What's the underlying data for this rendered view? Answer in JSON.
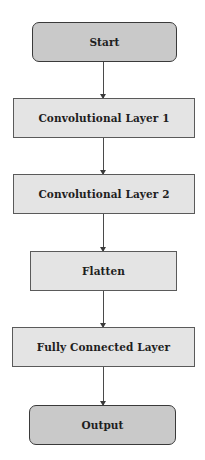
{
  "diagram": {
    "type": "flowchart",
    "direction": "top-to-bottom",
    "nodes": [
      {
        "id": "start",
        "label": "Start",
        "shape": "rounded-rectangle",
        "fill": "#c9c9c9"
      },
      {
        "id": "conv1",
        "label": "Convolutional Layer 1",
        "shape": "rectangle",
        "fill": "#e4e4e4"
      },
      {
        "id": "conv2",
        "label": "Convolutional Layer 2",
        "shape": "rectangle",
        "fill": "#e4e4e4"
      },
      {
        "id": "flatten",
        "label": "Flatten",
        "shape": "rectangle",
        "fill": "#e4e4e4"
      },
      {
        "id": "fc",
        "label": "Fully Connected Layer",
        "shape": "rectangle",
        "fill": "#e4e4e4"
      },
      {
        "id": "output",
        "label": "Output",
        "shape": "rounded-rectangle",
        "fill": "#c9c9c9"
      }
    ],
    "edges": [
      {
        "from": "start",
        "to": "conv1"
      },
      {
        "from": "conv1",
        "to": "conv2"
      },
      {
        "from": "conv2",
        "to": "flatten"
      },
      {
        "from": "flatten",
        "to": "fc"
      },
      {
        "from": "fc",
        "to": "output"
      }
    ]
  },
  "colors": {
    "terminal_fill": "#c9c9c9",
    "process_fill": "#e4e4e4",
    "border": "#4a4a4a",
    "arrow": "#4a4a4a",
    "background": "#ffffff"
  }
}
